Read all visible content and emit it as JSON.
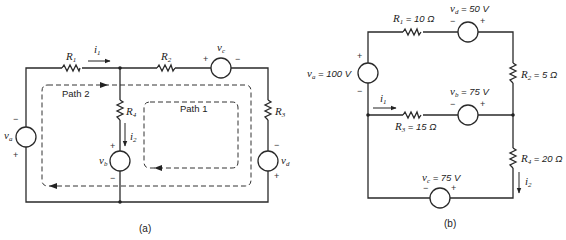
{
  "figure_a": {
    "caption": "(a)",
    "labels": {
      "R1": "R",
      "R1_sub": "1",
      "R2": "R",
      "R2_sub": "2",
      "R3": "R",
      "R3_sub": "3",
      "R4": "R",
      "R4_sub": "4",
      "va": "v",
      "va_sub": "a",
      "vb": "v",
      "vb_sub": "b",
      "vc": "v",
      "vc_sub": "c",
      "vd": "v",
      "vd_sub": "d",
      "i1": "i",
      "i1_sub": "1",
      "i2": "i",
      "i2_sub": "2",
      "path1": "Path 1",
      "path2": "Path 2"
    },
    "signs": {
      "plus": "+",
      "minus": "−"
    }
  },
  "figure_b": {
    "caption": "(b)",
    "labels": {
      "R1": "R",
      "R1_sub": "1",
      "R1_val": " = 10 Ω",
      "R2": "R",
      "R2_sub": "2",
      "R2_val": " = 5 Ω",
      "R3": "R",
      "R3_sub": "3",
      "R3_val": " = 15 Ω",
      "R4": "R",
      "R4_sub": "4",
      "R4_val": " = 20 Ω",
      "va": "v",
      "va_sub": "a",
      "va_val": " = 100 V",
      "vb": "v",
      "vb_sub": "b",
      "vb_val": " = 75 V",
      "vc": "v",
      "vc_sub": "c",
      "vc_val": " = 75 V",
      "vd": "v",
      "vd_sub": "d",
      "vd_val": " = 50 V",
      "i1": "i",
      "i1_sub": "1",
      "i2": "i",
      "i2_sub": "2"
    },
    "signs": {
      "plus": "+",
      "minus": "−"
    }
  }
}
